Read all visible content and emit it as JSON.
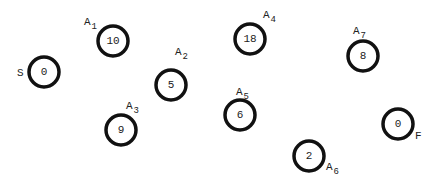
{
  "diagram": {
    "type": "activity-nodes",
    "nodes": [
      {
        "id": "S",
        "label": "S",
        "sub": "",
        "value": "0",
        "cx": 44,
        "cy": 72,
        "lx": 17,
        "ly": 76
      },
      {
        "id": "A1",
        "label": "A",
        "sub": "1",
        "value": "10",
        "cx": 113,
        "cy": 41,
        "lx": 84,
        "ly": 25
      },
      {
        "id": "A2",
        "label": "A",
        "sub": "2",
        "value": "5",
        "cx": 171,
        "cy": 85,
        "lx": 175,
        "ly": 55
      },
      {
        "id": "A3",
        "label": "A",
        "sub": "3",
        "value": "9",
        "cx": 121,
        "cy": 130,
        "lx": 126,
        "ly": 109
      },
      {
        "id": "A4",
        "label": "A",
        "sub": "4",
        "value": "18",
        "cx": 250,
        "cy": 39,
        "lx": 263,
        "ly": 18
      },
      {
        "id": "A5",
        "label": "A",
        "sub": "5",
        "value": "6",
        "cx": 240,
        "cy": 115,
        "lx": 236,
        "ly": 95
      },
      {
        "id": "A6",
        "label": "A",
        "sub": "6",
        "value": "2",
        "cx": 309,
        "cy": 156,
        "lx": 326,
        "ly": 170
      },
      {
        "id": "A7",
        "label": "A",
        "sub": "7",
        "value": "8",
        "cx": 363,
        "cy": 56,
        "lx": 353,
        "ly": 34
      },
      {
        "id": "F",
        "label": "F",
        "sub": "",
        "value": "0",
        "cx": 398,
        "cy": 124,
        "lx": 415,
        "ly": 139
      }
    ]
  }
}
